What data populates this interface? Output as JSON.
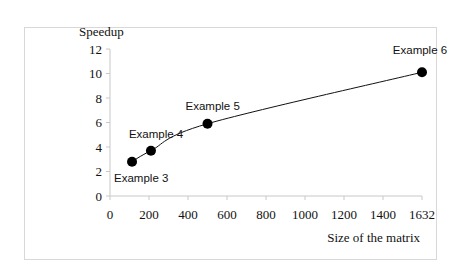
{
  "chart_data": {
    "type": "line",
    "title": "",
    "xlabel": "Size of the matrix",
    "ylabel": "Speedup",
    "x_ticks": [
      "0",
      "200",
      "400",
      "600",
      "800",
      "1000",
      "1200",
      "1400",
      "1632"
    ],
    "y_ticks": [
      "0",
      "2",
      "4",
      "6",
      "8",
      "10",
      "12"
    ],
    "ylim": [
      0,
      12
    ],
    "xlim": [
      0,
      1632
    ],
    "grid": false,
    "legend": null,
    "series": [
      {
        "name": "Speedup",
        "points": [
          {
            "label": "Example 3",
            "x": 113,
            "y": 2.8
          },
          {
            "label": "Example 4",
            "x": 210,
            "y": 3.7
          },
          {
            "label": "Example 5",
            "x": 500,
            "y": 5.9
          },
          {
            "label": "Example 6",
            "x": 1632,
            "y": 10.1
          }
        ]
      }
    ],
    "annotations": [
      "Example 3",
      "Example 4",
      "Example 5",
      "Example 6"
    ]
  }
}
